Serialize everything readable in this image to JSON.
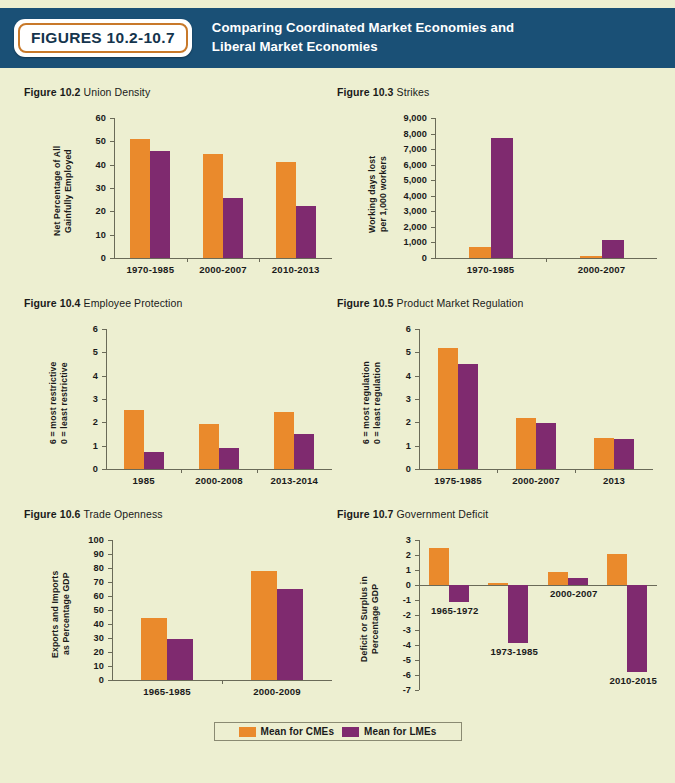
{
  "header": {
    "badge": "FIGURES 10.2-10.7",
    "title_line1": "Comparing Coordinated Market Economies and",
    "title_line2": "Liberal Market Economies",
    "bg_color": "#1a5076",
    "badge_border_color": "#c8792a"
  },
  "page": {
    "background_color": "#edefd1"
  },
  "legend": {
    "items": [
      {
        "label": "Mean for CMEs",
        "color": "#ea8a2c",
        "key": "cme"
      },
      {
        "label": "Mean for LMEs",
        "color": "#7f2a6f",
        "key": "lme"
      }
    ]
  },
  "chart_data": [
    {
      "id": "fig-10-2",
      "type": "bar",
      "number": "Figure 10.2",
      "title": "Union Density",
      "ylabel": "Net Percentage of All\nGainfully Employed",
      "xlabel": "",
      "ylim": [
        0,
        60
      ],
      "yticks": [
        0,
        10,
        20,
        30,
        40,
        50,
        60
      ],
      "ytick_labels": [
        "0",
        "10",
        "20",
        "30",
        "40",
        "50",
        "60"
      ],
      "grid": false,
      "legend_position": "bottom-shared",
      "categories": [
        "1970-1985",
        "2000-2007",
        "2010-2013"
      ],
      "series": [
        {
          "name": "Mean for CMEs",
          "color": "#ea8a2c",
          "values": [
            51.0,
            44.7,
            41.2
          ]
        },
        {
          "name": "Mean for LMEs",
          "color": "#7f2a6f",
          "values": [
            46.0,
            25.7,
            22.5
          ]
        }
      ]
    },
    {
      "id": "fig-10-3",
      "type": "bar",
      "number": "Figure 10.3",
      "title": "Strikes",
      "ylabel": "Working days lost\nper 1,000 workers",
      "xlabel": "",
      "ylim": [
        0,
        9000
      ],
      "yticks": [
        0,
        1000,
        2000,
        3000,
        4000,
        5000,
        6000,
        7000,
        8000,
        9000
      ],
      "ytick_labels": [
        "0",
        "1,000",
        "2,000",
        "3,000",
        "4,000",
        "5,000",
        "6,000",
        "7,000",
        "8,000",
        "9,000"
      ],
      "grid": false,
      "legend_position": "bottom-shared",
      "categories": [
        "1970-1985",
        "2000-2007"
      ],
      "series": [
        {
          "name": "Mean for CMEs",
          "color": "#ea8a2c",
          "values": [
            700,
            110
          ]
        },
        {
          "name": "Mean for LMEs",
          "color": "#7f2a6f",
          "values": [
            7700,
            1150
          ]
        }
      ]
    },
    {
      "id": "fig-10-4",
      "type": "bar",
      "number": "Figure 10.4",
      "title": "Employee Protection",
      "ylabel": "6 = most restrictive\n0 = least restrictive",
      "xlabel": "",
      "ylim": [
        0,
        6
      ],
      "yticks": [
        0,
        1,
        2,
        3,
        4,
        5,
        6
      ],
      "ytick_labels": [
        "0",
        "1",
        "2",
        "3",
        "4",
        "5",
        "6"
      ],
      "grid": false,
      "legend_position": "bottom-shared",
      "categories": [
        "1985",
        "2000-2008",
        "2013-2014"
      ],
      "series": [
        {
          "name": "Mean for CMEs",
          "color": "#ea8a2c",
          "values": [
            2.55,
            1.95,
            2.45
          ]
        },
        {
          "name": "Mean for LMEs",
          "color": "#7f2a6f",
          "values": [
            0.72,
            0.92,
            1.48
          ]
        }
      ]
    },
    {
      "id": "fig-10-5",
      "type": "bar",
      "number": "Figure 10.5",
      "title": "Product Market Regulation",
      "ylabel": "6 = most regulation\n0 = least regulation",
      "xlabel": "",
      "ylim": [
        0,
        6
      ],
      "yticks": [
        0,
        1,
        2,
        3,
        4,
        5,
        6
      ],
      "ytick_labels": [
        "0",
        "1",
        "2",
        "3",
        "4",
        "5",
        "6"
      ],
      "grid": false,
      "legend_position": "bottom-shared",
      "categories": [
        "1975-1985",
        "2000-2007",
        "2013"
      ],
      "series": [
        {
          "name": "Mean for CMEs",
          "color": "#ea8a2c",
          "values": [
            5.2,
            2.18,
            1.32
          ]
        },
        {
          "name": "Mean for LMEs",
          "color": "#7f2a6f",
          "values": [
            4.5,
            1.98,
            1.28
          ]
        }
      ]
    },
    {
      "id": "fig-10-6",
      "type": "bar",
      "number": "Figure 10.6",
      "title": "Trade Openness",
      "ylabel": "Exports and Imports\nas Percentage GDP",
      "xlabel": "",
      "ylim": [
        0,
        100
      ],
      "yticks": [
        0,
        10,
        20,
        30,
        40,
        50,
        60,
        70,
        80,
        90,
        100
      ],
      "ytick_labels": [
        "0",
        "10",
        "20",
        "30",
        "40",
        "50",
        "60",
        "70",
        "80",
        "90",
        "100"
      ],
      "grid": false,
      "legend_position": "bottom-shared",
      "categories": [
        "1965-1985",
        "2000-2009"
      ],
      "series": [
        {
          "name": "Mean for CMEs",
          "color": "#ea8a2c",
          "values": [
            44.5,
            78.0
          ]
        },
        {
          "name": "Mean for LMEs",
          "color": "#7f2a6f",
          "values": [
            29.0,
            65.0
          ]
        }
      ]
    },
    {
      "id": "fig-10-7",
      "type": "bar",
      "number": "Figure 10.7",
      "title": "Government Deficit",
      "ylabel": "Deficit or Surplus in\nPercentage GDP",
      "xlabel": "",
      "ylim": [
        -7,
        3
      ],
      "yticks": [
        -7,
        -6,
        -5,
        -4,
        -3,
        -2,
        -1,
        0,
        1,
        2,
        3
      ],
      "ytick_labels": [
        "-7",
        "-6",
        "-5",
        "-4",
        "-3",
        "-2",
        "-1",
        "0",
        "1",
        "2",
        "3"
      ],
      "grid": false,
      "legend_position": "bottom-shared",
      "categories": [
        "1965-1972",
        "1973-1985",
        "2000-2007",
        "2010-2015"
      ],
      "series": [
        {
          "name": "Mean for CMEs",
          "color": "#ea8a2c",
          "values": [
            2.5,
            0.15,
            0.9,
            2.05
          ]
        },
        {
          "name": "Mean for LMEs",
          "color": "#7f2a6f",
          "values": [
            -1.1,
            -3.85,
            0.45,
            -5.8
          ]
        }
      ]
    }
  ]
}
